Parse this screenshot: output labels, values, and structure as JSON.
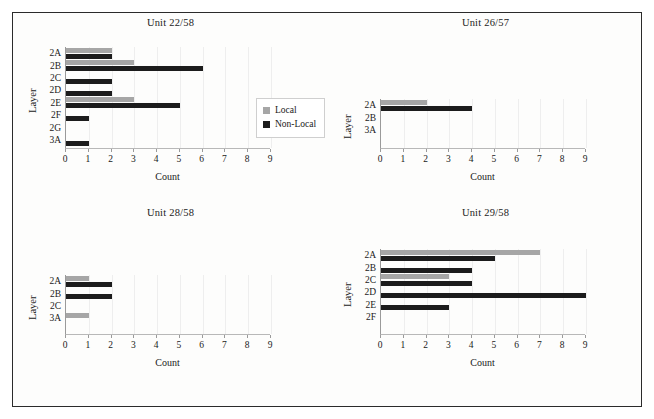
{
  "figure": {
    "axis_title_y": "Layer",
    "axis_title_x": "Count",
    "legend": {
      "position": "upper-right-of-panel-1",
      "entries": [
        {
          "label": "Local",
          "color": "#a6a6a6",
          "key": "local"
        },
        {
          "label": "Non-Local",
          "color": "#1c1c1c",
          "key": "nonlocal"
        }
      ]
    },
    "xticks": [
      "0",
      "1",
      "2",
      "3",
      "4",
      "5",
      "6",
      "7",
      "8",
      "9"
    ]
  },
  "chart_data": [
    {
      "type": "bar",
      "orientation": "horizontal",
      "title": "Unit 22/58",
      "xlabel": "Count",
      "ylabel": "Layer",
      "xlim": [
        0,
        9
      ],
      "grid": false,
      "categories": [
        "2A",
        "2B",
        "2C",
        "2D",
        "2E",
        "2F",
        "2G",
        "3A"
      ],
      "series": [
        {
          "name": "Local",
          "values": [
            2,
            3,
            0,
            0,
            3,
            0,
            0,
            0
          ]
        },
        {
          "name": "Non-Local",
          "values": [
            2,
            6,
            2,
            2,
            5,
            1,
            0,
            1
          ]
        }
      ]
    },
    {
      "type": "bar",
      "orientation": "horizontal",
      "title": "Unit 26/57",
      "xlabel": "Count",
      "ylabel": "Layer",
      "xlim": [
        0,
        9
      ],
      "grid": false,
      "categories": [
        "2A",
        "2B",
        "3A"
      ],
      "series": [
        {
          "name": "Local",
          "values": [
            2,
            0,
            0
          ]
        },
        {
          "name": "Non-Local",
          "values": [
            4,
            0,
            0
          ]
        }
      ]
    },
    {
      "type": "bar",
      "orientation": "horizontal",
      "title": "Unit 28/58",
      "xlabel": "Count",
      "ylabel": "Layer",
      "xlim": [
        0,
        9
      ],
      "grid": false,
      "categories": [
        "2A",
        "2B",
        "2C",
        "3A"
      ],
      "series": [
        {
          "name": "Local",
          "values": [
            1,
            0,
            0,
            1
          ]
        },
        {
          "name": "Non-Local",
          "values": [
            2,
            2,
            0,
            0
          ]
        }
      ]
    },
    {
      "type": "bar",
      "orientation": "horizontal",
      "title": "Unit 29/58",
      "xlabel": "Count",
      "ylabel": "Layer",
      "xlim": [
        0,
        9
      ],
      "grid": false,
      "categories": [
        "2A",
        "2B",
        "2C",
        "2D",
        "2E",
        "2F"
      ],
      "series": [
        {
          "name": "Local",
          "values": [
            7,
            0,
            3,
            0,
            0,
            0
          ]
        },
        {
          "name": "Non-Local",
          "values": [
            5,
            4,
            4,
            9,
            3,
            0
          ]
        }
      ]
    }
  ]
}
